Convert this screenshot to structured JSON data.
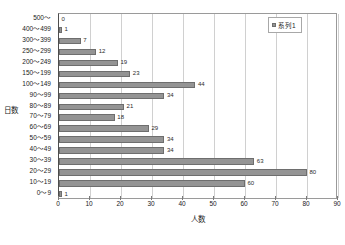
{
  "chart_data": {
    "type": "bar",
    "orientation": "horizontal",
    "title": "",
    "xlabel": "人数",
    "ylabel": "日数",
    "xlim": [
      0,
      90
    ],
    "xticks": [
      0,
      10,
      20,
      30,
      40,
      50,
      60,
      70,
      80,
      90
    ],
    "grid": true,
    "legend": {
      "position": "top-right",
      "entries": [
        "系列1"
      ]
    },
    "categories": [
      "500〜",
      "400〜499",
      "300〜399",
      "250〜299",
      "200〜249",
      "150〜199",
      "100〜149",
      "90〜99",
      "80〜89",
      "70〜79",
      "60〜69",
      "50〜59",
      "40〜49",
      "30〜39",
      "20〜29",
      "10〜19",
      "0〜9"
    ],
    "values": [
      0,
      1,
      7,
      12,
      19,
      23,
      44,
      34,
      21,
      18,
      29,
      34,
      34,
      63,
      80,
      60,
      1
    ],
    "series": [
      {
        "name": "系列1",
        "color": "#949494",
        "values": [
          0,
          1,
          7,
          12,
          19,
          23,
          44,
          34,
          21,
          18,
          29,
          34,
          34,
          63,
          80,
          60,
          1
        ]
      }
    ],
    "data_labels": [
      "0",
      "1",
      "7",
      "12",
      "19",
      "23",
      "44",
      "34",
      "21",
      "18",
      "29",
      "34",
      "34",
      "63",
      "80",
      "60",
      "1"
    ]
  },
  "colors": {
    "bar_fill": "#949494",
    "bar_border": "#6e6e6e",
    "grid": "#d0d0d0",
    "axis": "#4d4d4d",
    "plot_background": "#ffffff",
    "text": "#1a1a1a"
  }
}
